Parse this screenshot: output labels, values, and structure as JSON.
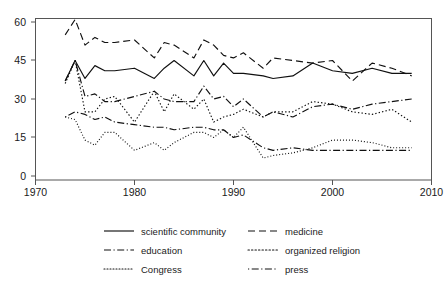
{
  "chart_data": {
    "type": "line",
    "title": "",
    "subtitle": "",
    "xlabel": "",
    "ylabel": "",
    "xlim": [
      1970,
      2010
    ],
    "ylim": [
      0,
      63
    ],
    "xticks": [
      1970,
      1980,
      1990,
      2000,
      2010
    ],
    "yticks": [
      0,
      15,
      30,
      45,
      60
    ],
    "xtick_labels": [
      "1970",
      "1980",
      "1990",
      "2000",
      "2010"
    ],
    "ytick_labels": [
      "0",
      "15",
      "30",
      "45",
      "60"
    ],
    "grid": false,
    "legend_position": "bottom",
    "x": [
      1973,
      1974,
      1975,
      1976,
      1977,
      1978,
      1980,
      1982,
      1983,
      1984,
      1986,
      1987,
      1988,
      1989,
      1990,
      1991,
      1993,
      1994,
      1996,
      1998,
      2000,
      2002,
      2004,
      2006,
      2008
    ],
    "series": [
      {
        "name": "scientific community",
        "style": "solid",
        "values": [
          37,
          45,
          38,
          43,
          41,
          41,
          42,
          38,
          42,
          45,
          39,
          45,
          39,
          44,
          40,
          40,
          39,
          38,
          39,
          44,
          41,
          40,
          42,
          40,
          40
        ]
      },
      {
        "name": "medicine",
        "style": "dashed",
        "values": [
          55,
          61,
          51,
          54,
          52,
          52,
          53,
          46,
          52,
          51,
          46,
          53,
          51,
          47,
          46,
          48,
          42,
          46,
          45,
          44,
          45,
          37,
          44,
          42,
          39
        ]
      },
      {
        "name": "education",
        "style": "dashdot",
        "values": [
          37,
          45,
          31,
          32,
          29,
          29,
          31,
          33,
          30,
          29,
          29,
          35,
          30,
          31,
          27,
          30,
          23,
          25,
          23,
          27,
          28,
          26,
          28,
          29,
          30
        ]
      },
      {
        "name": "organized religion",
        "style": "dotted",
        "values": [
          36,
          45,
          25,
          25,
          30,
          31,
          21,
          33,
          25,
          32,
          26,
          30,
          21,
          23,
          24,
          26,
          23,
          25,
          25,
          29,
          28,
          25,
          24,
          26,
          21
        ]
      },
      {
        "name": "Congress",
        "style": "finedotted",
        "values": [
          23,
          22,
          14,
          12,
          17,
          17,
          10,
          13,
          10,
          13,
          17,
          17,
          15,
          18,
          15,
          19,
          7,
          8,
          9,
          11,
          14,
          14,
          13,
          11,
          11
        ]
      },
      {
        "name": "press",
        "style": "dashdotdash",
        "values": [
          23,
          25,
          24,
          22,
          23,
          21,
          20,
          19,
          19,
          18,
          19,
          19,
          18,
          18,
          15,
          16,
          11,
          10,
          11,
          10,
          10,
          10,
          10,
          10,
          10
        ]
      }
    ]
  },
  "legend": {
    "entries": [
      {
        "label": "scientific community",
        "style": "solid"
      },
      {
        "label": "medicine",
        "style": "dashed"
      },
      {
        "label": "education",
        "style": "dashdot"
      },
      {
        "label": "organized religion",
        "style": "dotted"
      },
      {
        "label": "Congress",
        "style": "finedotted"
      },
      {
        "label": "press",
        "style": "dashdotdash"
      }
    ]
  },
  "colors": {
    "line": "#101010",
    "axis": "#555555",
    "background": "#ffffff",
    "text": "#1a1a1a"
  }
}
